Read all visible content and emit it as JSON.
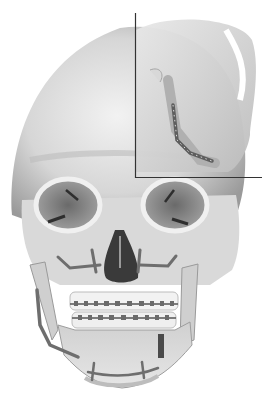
{
  "figure": {
    "subject": "Frontal view of human skull with surgical fixation plates and orthodontic braces",
    "inset": {
      "subject": "Lateral close-up view of mandible ramus with bone plate and screws",
      "position": "top-right"
    },
    "elements": [
      "cranium",
      "orbits",
      "nasal cavity",
      "maxilla fixation plates",
      "orthodontic brackets upper",
      "orthodontic brackets lower",
      "mandible left fixation plate",
      "mandible chin fixation plate",
      "mandible right osteotomy plate"
    ],
    "colors": {
      "background": "#ffffff",
      "bone_light": "#ececec",
      "bone_mid": "#c8c8c8",
      "bone_shadow": "#8e8e8e",
      "cavity_dark": "#3a3a3a",
      "plate": "#7a7a7a",
      "inset_line": "#333333"
    }
  }
}
